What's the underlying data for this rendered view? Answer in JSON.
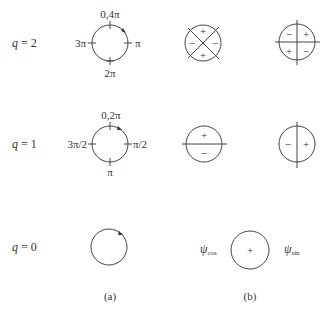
{
  "rows": [
    {
      "q_label": "q",
      "q_eq": "= 2",
      "ticks": {
        "top": "0,4π",
        "right": "π",
        "bottom": "2π",
        "left": "3π"
      },
      "b_left": {
        "signs": {
          "top": "+",
          "bottom": "+",
          "left": "−",
          "right": "−"
        }
      },
      "b_right": {
        "signs": {
          "tl": "−",
          "tr": "+",
          "bl": "+",
          "br": "−"
        }
      }
    },
    {
      "q_label": "q",
      "q_eq": "= 1",
      "ticks": {
        "top": "0,2π",
        "right": "π/2",
        "bottom": "π",
        "left": "3π/2"
      },
      "b_left": {
        "signs": {
          "top": "+",
          "bottom": "−"
        }
      },
      "b_right": {
        "signs": {
          "left": "−",
          "right": "+"
        }
      }
    },
    {
      "q_label": "q",
      "q_eq": "= 0",
      "b_center": {
        "sign": "+",
        "left_label": "ψ",
        "left_sub": "cos",
        "right_label": "ψ",
        "right_sub": "sin"
      }
    }
  ],
  "captions": {
    "a": "(a)",
    "b": "(b)"
  }
}
